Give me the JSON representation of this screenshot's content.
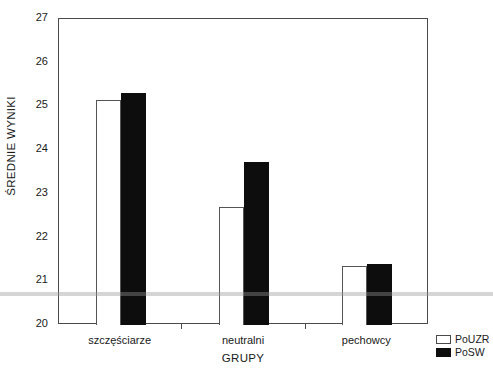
{
  "chart_data": {
    "type": "bar",
    "title": "",
    "subtitle": "",
    "xlabel": "GRUPY",
    "ylabel": "ŚREDNIE WYNIKI",
    "categories": [
      "szczęściarze",
      "neutralni",
      "pechowcy"
    ],
    "series": [
      {
        "name": "PoUZR",
        "color": "#ffffff",
        "values": [
          25.15,
          22.7,
          21.35
        ]
      },
      {
        "name": "PoSW",
        "color": "#0d0d0d",
        "values": [
          25.3,
          23.73,
          21.4
        ]
      }
    ],
    "ylim": [
      20,
      27
    ],
    "ytick_labels": [
      "20",
      "21",
      "22",
      "23",
      "24",
      "25",
      "26",
      "27"
    ],
    "ytick_values": [
      20,
      21,
      22,
      23,
      24,
      25,
      26,
      27
    ],
    "grid": false,
    "legend_position": "bottom-right-outside",
    "legend_entries": [
      {
        "label": "PoUZR",
        "swatch": "white"
      },
      {
        "label": "PoSW",
        "swatch": "black"
      }
    ]
  },
  "axes": {
    "y_label": "ŚREDNIE WYNIKI",
    "x_label": "GRUPY"
  },
  "legend": {
    "items": [
      {
        "label": "PoUZR"
      },
      {
        "label": "PoSW"
      }
    ]
  }
}
